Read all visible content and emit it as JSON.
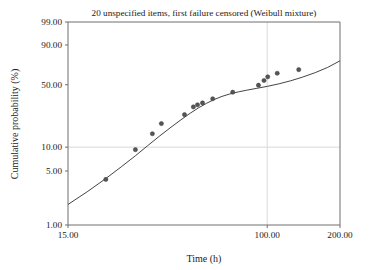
{
  "chart_data": {
    "type": "scatter",
    "title": "20 unspecified items, first failure censored (Weibull mixture)",
    "xlabel": "Time (h)",
    "ylabel": "Cumulative probability (%)",
    "xscale": "log",
    "yscale": "weibull-probability",
    "xlim": [
      15.0,
      200.0
    ],
    "ylim": [
      1.0,
      99.0
    ],
    "grid": true,
    "x_ticks": [
      "15.00",
      "100.00",
      "200.00"
    ],
    "x_tick_values": [
      15.0,
      100.0,
      200.0
    ],
    "y_ticks": [
      "99.00",
      "90.00",
      "50.00",
      "10.00",
      "5.00",
      "1.00"
    ],
    "y_tick_values": [
      99.0,
      90.0,
      50.0,
      10.0,
      5.0,
      1.0
    ],
    "gridlines_y": [
      10.0
    ],
    "gridlines_x": [
      100.0
    ],
    "series": [
      {
        "name": "Median ranks (observed failures)",
        "type": "scatter",
        "marker": "filled-circle",
        "color": "#555555",
        "points": [
          {
            "x": 21.5,
            "y": 3.9
          },
          {
            "x": 28.5,
            "y": 9.3
          },
          {
            "x": 33.5,
            "y": 14.6
          },
          {
            "x": 36.5,
            "y": 19.3
          },
          {
            "x": 45.5,
            "y": 24.5
          },
          {
            "x": 49.5,
            "y": 29.9
          },
          {
            "x": 51.5,
            "y": 31.5
          },
          {
            "x": 54.0,
            "y": 33.0
          },
          {
            "x": 59.5,
            "y": 36.5
          },
          {
            "x": 72.0,
            "y": 42.5
          },
          {
            "x": 92.0,
            "y": 49.5
          },
          {
            "x": 97.0,
            "y": 54.5
          },
          {
            "x": 100.5,
            "y": 58.5
          },
          {
            "x": 110.0,
            "y": 62.5
          },
          {
            "x": 135.0,
            "y": 66.5
          }
        ]
      },
      {
        "name": "Weibull mixture fit",
        "type": "line",
        "color": "#444444",
        "points": [
          {
            "x": 15.0,
            "y": 1.85
          },
          {
            "x": 18.0,
            "y": 2.7
          },
          {
            "x": 21.5,
            "y": 4.0
          },
          {
            "x": 25.0,
            "y": 5.7
          },
          {
            "x": 28.5,
            "y": 7.8
          },
          {
            "x": 32.0,
            "y": 10.4
          },
          {
            "x": 36.0,
            "y": 13.8
          },
          {
            "x": 40.0,
            "y": 17.5
          },
          {
            "x": 44.0,
            "y": 21.4
          },
          {
            "x": 48.0,
            "y": 25.4
          },
          {
            "x": 52.0,
            "y": 29.2
          },
          {
            "x": 56.0,
            "y": 32.6
          },
          {
            "x": 60.0,
            "y": 35.6
          },
          {
            "x": 65.0,
            "y": 38.6
          },
          {
            "x": 70.0,
            "y": 40.8
          },
          {
            "x": 76.0,
            "y": 42.8
          },
          {
            "x": 82.0,
            "y": 44.4
          },
          {
            "x": 90.0,
            "y": 46.2
          },
          {
            "x": 100.0,
            "y": 48.3
          },
          {
            "x": 112.0,
            "y": 51.0
          },
          {
            "x": 125.0,
            "y": 54.2
          },
          {
            "x": 140.0,
            "y": 58.2
          },
          {
            "x": 158.0,
            "y": 63.2
          },
          {
            "x": 178.0,
            "y": 69.0
          },
          {
            "x": 200.0,
            "y": 76.0
          }
        ]
      }
    ]
  },
  "style": {
    "frame_color": "#6e6e6e",
    "grid_color": "#d9d9d9",
    "marker_color": "#555555",
    "curve_color": "#444444",
    "text_color": "#1a1a1a",
    "background": "#ffffff"
  }
}
